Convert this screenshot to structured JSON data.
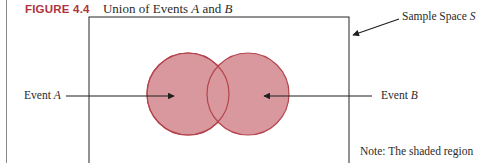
{
  "figure": {
    "number": "FIGURE 4.4",
    "caption_prefix": "Union of Events ",
    "caption_var_a": "A",
    "caption_mid": " and ",
    "caption_var_b": "B",
    "number_color": "#b0343f"
  },
  "diagram": {
    "sample_space": {
      "label_prefix": "Sample Space ",
      "label_var": "S",
      "rect": {
        "x": 89,
        "y": 17,
        "width": 260,
        "height": 160
      }
    },
    "event_a": {
      "label_prefix": "Event ",
      "label_var": "A",
      "circle": {
        "cx": 188,
        "cy": 94,
        "r": 41
      }
    },
    "event_b": {
      "label_prefix": "Event ",
      "label_var": "B",
      "circle": {
        "cx": 248,
        "cy": 94,
        "r": 41
      }
    },
    "fill_color": "#d9989d",
    "stroke_color": "#b4444e"
  },
  "note": {
    "text": "Note:  The shaded region"
  }
}
